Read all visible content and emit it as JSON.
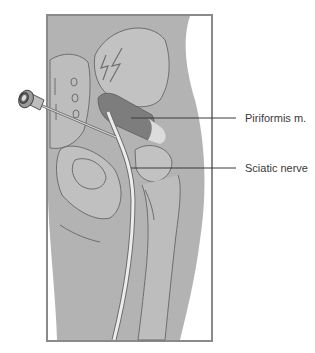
{
  "figure": {
    "labels": [
      {
        "id": "piriformis",
        "text": "Piriformis m."
      },
      {
        "id": "sciatic",
        "text": "Sciatic nerve"
      }
    ],
    "colors": {
      "background": "#ffffff",
      "frame": "#8a8a8a",
      "tissue": "#b3b3b3",
      "bone": "#c2c2c2",
      "outline": "#6e6e6e",
      "muscle": "#7d7d7d",
      "nerve": "#ececec",
      "tendon": "#dcdcdc",
      "needle": "#bdbdbd",
      "leader_line": "#3a3a3a"
    }
  }
}
